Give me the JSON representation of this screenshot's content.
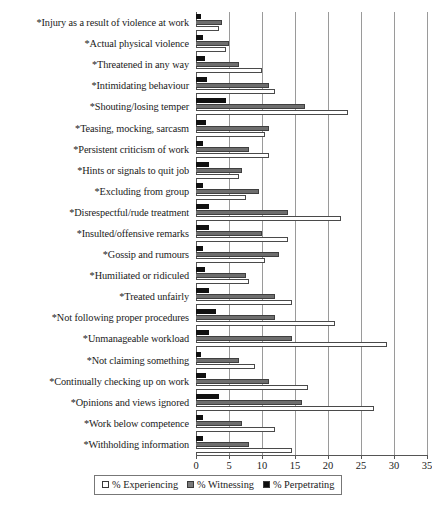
{
  "chart_data": {
    "type": "bar",
    "orientation": "horizontal",
    "title": "",
    "subtitle": "",
    "xlabel": "",
    "ylabel": "",
    "xlim": [
      0,
      35
    ],
    "xticks": [
      0,
      5,
      10,
      15,
      20,
      25,
      30,
      35
    ],
    "xtick_labels": [
      "0",
      "5",
      "10",
      "15",
      "20",
      "25",
      "30",
      "35"
    ],
    "grid": true,
    "legend_position": "bottom",
    "categories": [
      "*Injury as a result of violence at work",
      "*Actual physical violence",
      "*Threatened in any way",
      "*Intimidating behaviour",
      "*Shouting/losing temper",
      "*Teasing, mocking, sarcasm",
      "*Persistent criticism of work",
      "*Hints or signals to quit job",
      "*Excluding from group",
      "*Disrespectful/rude treatment",
      "*Insulted/offensive remarks",
      "*Gossip and rumours",
      "*Humiliated or ridiculed",
      "*Treated unfairly",
      "*Not following proper procedures",
      "*Unmanageable workload",
      "*Not claiming something",
      "*Continually checking up on work",
      "*Opinions and views ignored",
      "*Work below competence",
      "*Withholding information"
    ],
    "series": [
      {
        "name": "% Experiencing",
        "color": "#ffffff",
        "values": [
          3.5,
          4.5,
          10.0,
          12.0,
          23.0,
          10.5,
          11.0,
          6.5,
          7.5,
          22.0,
          14.0,
          10.5,
          8.0,
          14.5,
          21.0,
          29.0,
          9.0,
          17.0,
          27.0,
          12.0,
          14.5
        ]
      },
      {
        "name": "% Witnessing",
        "color": "#6e6e6e",
        "values": [
          4.0,
          5.0,
          6.5,
          11.0,
          16.5,
          11.0,
          8.0,
          7.0,
          9.5,
          14.0,
          10.0,
          12.5,
          7.5,
          12.0,
          12.0,
          14.5,
          6.5,
          11.0,
          16.0,
          7.0,
          8.0
        ]
      },
      {
        "name": "% Perpetrating",
        "color": "#111111",
        "values": [
          0.8,
          1.0,
          1.3,
          1.6,
          4.5,
          1.5,
          1.0,
          2.0,
          1.0,
          2.0,
          2.0,
          1.0,
          1.3,
          2.0,
          3.0,
          2.0,
          0.7,
          1.5,
          3.5,
          1.0,
          1.0
        ]
      }
    ]
  },
  "legend": {
    "items": [
      {
        "label": "% Experiencing",
        "swatch": "experiencing"
      },
      {
        "label": "% Witnessing",
        "swatch": "witnessing"
      },
      {
        "label": "% Perpetrating",
        "swatch": "perpetrating"
      }
    ]
  }
}
